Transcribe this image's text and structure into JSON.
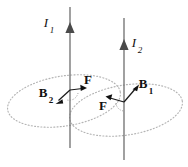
{
  "figure": {
    "background_color": "#ffffff",
    "width": 188,
    "height": 167
  },
  "colors": {
    "wire": "#6e6e6e",
    "wire_arrow": "#4a4a4a",
    "field_ellipse": "#b4b4b4",
    "vector": "#111111",
    "label": "#111111"
  },
  "wires": [
    {
      "id": "wire-1",
      "current_label": "I",
      "current_subscript": "1",
      "direction": "upward",
      "x": 70,
      "y_top": 7,
      "y_bottom": 148,
      "arrow_y": 30
    },
    {
      "id": "wire-2",
      "current_label": "I",
      "current_subscript": "2",
      "direction": "upward",
      "x": 124,
      "y_top": 18,
      "y_bottom": 160,
      "arrow_y": 47
    }
  ],
  "field_loops": [
    {
      "id": "field-loop-1",
      "center_x": 64,
      "center_y": 101,
      "radius_x": 57,
      "radius_y": 25,
      "rotation_deg": -9,
      "style": "dotted"
    },
    {
      "id": "field-loop-2",
      "center_x": 126,
      "center_y": 110,
      "radius_x": 57,
      "radius_y": 25,
      "rotation_deg": -9,
      "style": "dotted"
    }
  ],
  "vectors": [
    {
      "id": "vector-B2",
      "label": "B",
      "subscript": "2",
      "meaning": "magnetic field of wire 2 at wire 1",
      "origin_x": 70,
      "origin_y": 90,
      "tip_x": 56,
      "tip_y": 103,
      "label_x": 43,
      "label_y": 94,
      "sub_x": 52,
      "sub_y": 100
    },
    {
      "id": "vector-F-left",
      "label": "F",
      "subscript": "",
      "meaning": "force on wire 1 toward wire 2",
      "origin_x": 70,
      "origin_y": 90,
      "tip_x": 86,
      "tip_y": 88,
      "label_x": 88,
      "label_y": 81,
      "sub_x": 0,
      "sub_y": 0
    },
    {
      "id": "vector-B1",
      "label": "B",
      "subscript": "1",
      "meaning": "magnetic field of wire 1 at wire 2",
      "origin_x": 124,
      "origin_y": 102,
      "tip_x": 139,
      "tip_y": 85,
      "label_x": 141,
      "label_y": 85,
      "sub_x": 150,
      "sub_y": 91
    },
    {
      "id": "vector-F-right",
      "label": "F",
      "subscript": "",
      "meaning": "force on wire 2 toward wire 1",
      "origin_x": 124,
      "origin_y": 102,
      "tip_x": 106,
      "tip_y": 97,
      "label_x": 102,
      "label_y": 106,
      "sub_x": 0,
      "sub_y": 0
    }
  ],
  "annotations": {
    "arc_left": {
      "id": "angle-arc-left",
      "description": "dotted arc between B2 and F at wire 1"
    },
    "arc_right": {
      "id": "angle-arc-right",
      "description": "dotted arc near wire 2 vertex"
    }
  }
}
